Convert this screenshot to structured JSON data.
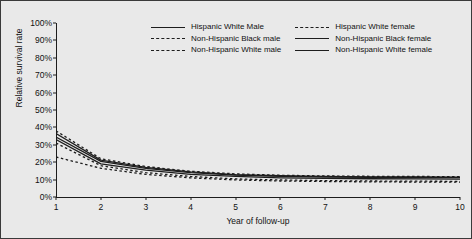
{
  "chart_data": {
    "type": "line",
    "title": "",
    "xlabel": "Year of follow-up",
    "ylabel": "Relative survival rate",
    "xlim": [
      1,
      10
    ],
    "ylim": [
      0,
      100
    ],
    "ytick_labels": [
      "0%",
      "10%",
      "20%",
      "30%",
      "40%",
      "50%",
      "60%",
      "70%",
      "80%",
      "90%",
      "100%"
    ],
    "ytick_values": [
      0,
      10,
      20,
      30,
      40,
      50,
      60,
      70,
      80,
      90,
      100
    ],
    "xtick_labels": [
      "1",
      "2",
      "3",
      "4",
      "5",
      "6",
      "7",
      "8",
      "9",
      "10"
    ],
    "x": [
      1,
      2,
      3,
      4,
      5,
      6,
      7,
      8,
      9,
      10
    ],
    "grid": false,
    "legend_position": "top-right",
    "series": [
      {
        "name": "Hispanic White Male",
        "style": "solid",
        "color": "#1d1d1d",
        "values": [
          33.0,
          19.0,
          15.5,
          13.0,
          11.8,
          11.0,
          10.7,
          10.5,
          10.4,
          10.3
        ]
      },
      {
        "name": "Non-Hispanic Black male",
        "style": "dashed",
        "color": "#1d1d1d",
        "values": [
          23.0,
          16.5,
          13.0,
          11.0,
          9.8,
          9.2,
          8.9,
          8.7,
          8.6,
          8.5
        ]
      },
      {
        "name": "Non-Hispanic White male",
        "style": "dashed",
        "color": "#1d1d1d",
        "values": [
          31.0,
          18.0,
          14.0,
          11.8,
          10.4,
          9.8,
          9.4,
          9.2,
          9.1,
          9.0
        ]
      },
      {
        "name": "Hispanic White female",
        "style": "dashed",
        "color": "#1d1d1d",
        "values": [
          38.0,
          22.0,
          17.5,
          14.8,
          13.3,
          12.5,
          12.1,
          11.9,
          11.8,
          11.7
        ]
      },
      {
        "name": "Non-Hispanic Black female",
        "style": "solid",
        "color": "#1d1d1d",
        "values": [
          34.5,
          20.5,
          16.5,
          14.0,
          12.6,
          11.9,
          11.5,
          11.3,
          11.2,
          11.1
        ]
      },
      {
        "name": "Non-Hispanic White female",
        "style": "solid",
        "color": "#1d1d1d",
        "values": [
          36.5,
          21.2,
          17.0,
          14.4,
          12.9,
          12.2,
          11.8,
          11.6,
          11.5,
          11.4
        ]
      }
    ]
  },
  "legend": {
    "columns": [
      {
        "entries": [
          {
            "label": "Hispanic White Male",
            "style": "solid"
          },
          {
            "label": "Non-Hispanic Black male",
            "style": "dashed"
          },
          {
            "label": "Non-Hispanic White male",
            "style": "dashed"
          }
        ]
      },
      {
        "entries": [
          {
            "label": "Hispanic White female",
            "style": "dashed"
          },
          {
            "label": "Non-Hispanic Black female",
            "style": "solid"
          },
          {
            "label": "Non-Hispanic White female",
            "style": "solid"
          }
        ]
      }
    ]
  }
}
